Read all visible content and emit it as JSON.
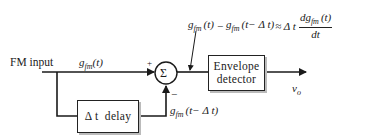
{
  "diagram": {
    "input_label": "FM input",
    "signal_top": {
      "base": "g",
      "sub": "fm",
      "arg": "(t)"
    },
    "signal_delayed": {
      "base": "g",
      "sub": "fm",
      "arg": "(t− Δ t)"
    },
    "formula": {
      "lhs1": {
        "base": "g",
        "sub": "fm",
        "arg": "(t)"
      },
      "minus": "−",
      "lhs2": {
        "base": "g",
        "sub": "fm",
        "arg": "(t− Δ t)"
      },
      "approx": "≈ Δ t",
      "frac_num": {
        "prefix": "d",
        "base": "g",
        "sub": "fm",
        "arg": "(t)"
      },
      "frac_den": "dt"
    },
    "summer": {
      "symbol": "Σ",
      "plus_sign": "+",
      "minus_sign": "−"
    },
    "delay_block": {
      "label": "Δ t  delay"
    },
    "envelope_block": {
      "line1": "Envelope",
      "line2": "detector"
    },
    "output_label": {
      "base": "v",
      "sub": "o"
    }
  },
  "colors": {
    "line": "#1a1a1a",
    "background": "#ffffff",
    "box_shadow": "#bbbbbb"
  }
}
